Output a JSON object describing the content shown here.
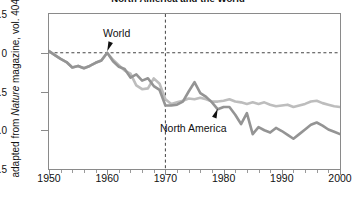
{
  "chart_data": {
    "type": "line",
    "title": "North America and the World",
    "xlabel": "",
    "ylabel": "adapted from Nature magazine, vol. 404",
    "ylabel_parts": {
      "pre": "adapted from ",
      "italic": "Nature",
      "post": " magazine, vol. 404"
    },
    "xlim": [
      1950,
      2000
    ],
    "ylim": [
      -1.5,
      0.5
    ],
    "xticks": [
      1950,
      1960,
      1970,
      1980,
      1990,
      2000
    ],
    "xtick_labels": [
      "1950",
      "1960",
      "1970",
      "1980",
      "1990",
      "2000"
    ],
    "xminor_step": 2,
    "yticks": [
      0.5,
      0,
      -0.5,
      -1.0,
      -1.5
    ],
    "ytick_labels": [
      "0.5",
      "0",
      "−0.5",
      "−1.0",
      "−1.5"
    ],
    "grid": false,
    "reference_lines": [
      {
        "axis": "y",
        "value": 0,
        "style": "dashed",
        "color": "#444444"
      },
      {
        "axis": "x",
        "value": 1970,
        "style": "dashed",
        "color": "#444444"
      }
    ],
    "legend": "annotations",
    "annotations": [
      {
        "text": "World",
        "x": 1960,
        "y": 0.02,
        "label_x": 1959.5,
        "label_y": 0.3
      },
      {
        "text": "North America",
        "x": 1979,
        "y": -0.72,
        "label_x": 1979,
        "label_y": -1.03
      }
    ],
    "series": [
      {
        "name": "World",
        "color": "#bdbdbd",
        "x": [
          1950,
          1951,
          1952,
          1953,
          1954,
          1955,
          1956,
          1957,
          1958,
          1959,
          1960,
          1961,
          1962,
          1963,
          1964,
          1965,
          1966,
          1967,
          1968,
          1969,
          1970,
          1971,
          1972,
          1973,
          1974,
          1975,
          1976,
          1977,
          1978,
          1979,
          1980,
          1981,
          1982,
          1983,
          1984,
          1985,
          1986,
          1987,
          1988,
          1989,
          1990,
          1991,
          1992,
          1993,
          1994,
          1995,
          1996,
          1997,
          1998,
          1999,
          2000
        ],
        "values": [
          0.02,
          -0.03,
          -0.08,
          -0.12,
          -0.19,
          -0.17,
          -0.2,
          -0.17,
          -0.13,
          -0.1,
          0.0,
          -0.09,
          -0.16,
          -0.23,
          -0.27,
          -0.42,
          -0.47,
          -0.46,
          -0.33,
          -0.4,
          -0.6,
          -0.66,
          -0.64,
          -0.62,
          -0.59,
          -0.6,
          -0.58,
          -0.6,
          -0.63,
          -0.63,
          -0.62,
          -0.6,
          -0.63,
          -0.64,
          -0.66,
          -0.64,
          -0.66,
          -0.64,
          -0.67,
          -0.69,
          -0.68,
          -0.67,
          -0.7,
          -0.68,
          -0.66,
          -0.63,
          -0.62,
          -0.65,
          -0.67,
          -0.69,
          -0.7
        ]
      },
      {
        "name": "North America",
        "color": "#949494",
        "x": [
          1950,
          1951,
          1952,
          1953,
          1954,
          1955,
          1956,
          1957,
          1958,
          1959,
          1960,
          1961,
          1962,
          1963,
          1964,
          1965,
          1966,
          1967,
          1968,
          1969,
          1970,
          1971,
          1972,
          1973,
          1974,
          1975,
          1976,
          1977,
          1978,
          1979,
          1980,
          1981,
          1982,
          1983,
          1984,
          1985,
          1986,
          1987,
          1988,
          1989,
          1990,
          1991,
          1992,
          1993,
          1994,
          1995,
          1996,
          1997,
          1998,
          1999,
          2000
        ],
        "values": [
          0.02,
          -0.03,
          -0.08,
          -0.12,
          -0.19,
          -0.17,
          -0.2,
          -0.17,
          -0.13,
          -0.1,
          0.0,
          -0.11,
          -0.18,
          -0.21,
          -0.32,
          -0.28,
          -0.36,
          -0.33,
          -0.43,
          -0.48,
          -0.68,
          -0.68,
          -0.67,
          -0.63,
          -0.5,
          -0.38,
          -0.52,
          -0.57,
          -0.64,
          -0.73,
          -0.7,
          -0.7,
          -0.8,
          -0.92,
          -0.78,
          -1.05,
          -0.96,
          -1.0,
          -1.03,
          -0.97,
          -1.01,
          -1.06,
          -1.11,
          -1.05,
          -0.99,
          -0.93,
          -0.9,
          -0.94,
          -0.99,
          -1.02,
          -1.05
        ]
      }
    ]
  }
}
